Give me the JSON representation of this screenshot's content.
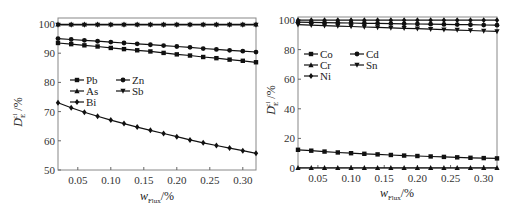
{
  "chart_data": [
    {
      "type": "line",
      "panel": "left",
      "title": "",
      "xlabel": "w_Flux/%",
      "ylabel": "D_E^cl /%",
      "xlim": [
        0.02,
        0.32
      ],
      "ylim": [
        50,
        100
      ],
      "xticks": [
        "0.05",
        "0.10",
        "0.15",
        "0.20",
        "0.25",
        "0.30"
      ],
      "yticks": [
        "50",
        "60",
        "70",
        "80",
        "90",
        "100"
      ],
      "grid": false,
      "legend_position": "upper-left-inside",
      "x": [
        0.02,
        0.04,
        0.06,
        0.08,
        0.1,
        0.12,
        0.14,
        0.16,
        0.18,
        0.2,
        0.22,
        0.24,
        0.26,
        0.28,
        0.3,
        0.32
      ],
      "series": [
        {
          "name": "Pb",
          "marker": "square",
          "values": [
            93.5,
            93.1,
            92.7,
            92.3,
            91.8,
            91.4,
            91.0,
            90.6,
            90.1,
            89.6,
            89.2,
            88.7,
            88.3,
            87.8,
            87.4,
            86.9
          ]
        },
        {
          "name": "Zn",
          "marker": "circle",
          "values": [
            95.0,
            94.7,
            94.4,
            94.1,
            93.8,
            93.5,
            93.2,
            92.9,
            92.6,
            92.3,
            92.0,
            91.6,
            91.3,
            91.0,
            90.7,
            90.4
          ]
        },
        {
          "name": "As",
          "marker": "triangle-up",
          "values": [
            99.9,
            99.9,
            99.9,
            99.9,
            99.9,
            99.9,
            99.9,
            99.9,
            99.9,
            99.9,
            99.9,
            99.9,
            99.9,
            99.9,
            99.9,
            99.9
          ]
        },
        {
          "name": "Sb",
          "marker": "triangle-down",
          "values": [
            99.7,
            99.7,
            99.7,
            99.7,
            99.7,
            99.7,
            99.7,
            99.7,
            99.7,
            99.7,
            99.7,
            99.7,
            99.7,
            99.7,
            99.7,
            99.7
          ]
        },
        {
          "name": "Bi",
          "marker": "diamond",
          "values": [
            73.0,
            71.3,
            69.8,
            68.4,
            67.1,
            65.9,
            64.7,
            63.6,
            62.5,
            61.4,
            60.3,
            59.3,
            58.4,
            57.5,
            56.6,
            55.7
          ]
        }
      ]
    },
    {
      "type": "line",
      "panel": "right",
      "title": "",
      "xlabel": "w_Flux/%",
      "ylabel": "D_E^cl /%",
      "xlim": [
        0.02,
        0.32
      ],
      "ylim": [
        0,
        100
      ],
      "xticks": [
        "0.05",
        "0.10",
        "0.15",
        "0.20",
        "0.25",
        "0.30"
      ],
      "yticks": [
        "0",
        "20",
        "40",
        "60",
        "80",
        "100"
      ],
      "grid": false,
      "legend_position": "upper-left-inside",
      "x": [
        0.02,
        0.04,
        0.06,
        0.08,
        0.1,
        0.12,
        0.14,
        0.16,
        0.18,
        0.2,
        0.22,
        0.24,
        0.26,
        0.28,
        0.3,
        0.32
      ],
      "series": [
        {
          "name": "Co",
          "marker": "square",
          "values": [
            12.3,
            11.7,
            11.1,
            10.5,
            10.0,
            9.6,
            9.2,
            8.8,
            8.4,
            8.1,
            7.8,
            7.5,
            7.2,
            6.9,
            6.7,
            6.5
          ]
        },
        {
          "name": "Cd",
          "marker": "circle",
          "values": [
            98.5,
            98.4,
            98.2,
            98.1,
            98.0,
            97.8,
            97.7,
            97.6,
            97.4,
            97.3,
            97.2,
            97.0,
            96.9,
            96.8,
            96.6,
            96.5
          ]
        },
        {
          "name": "Cr",
          "marker": "triangle-up",
          "values": [
            0.1,
            0.1,
            0.1,
            0.1,
            0.1,
            0.1,
            0.1,
            0.1,
            0.1,
            0.1,
            0.1,
            0.1,
            0.1,
            0.1,
            0.1,
            0.1
          ]
        },
        {
          "name": "Sn",
          "marker": "triangle-down",
          "values": [
            96.8,
            96.5,
            96.2,
            95.9,
            95.6,
            95.3,
            95.0,
            94.7,
            94.4,
            94.1,
            93.8,
            93.5,
            93.2,
            92.9,
            92.6,
            92.3
          ]
        },
        {
          "name": "Ni",
          "marker": "diamond",
          "values": [
            99.9,
            99.9,
            99.9,
            99.9,
            99.9,
            99.9,
            99.9,
            99.9,
            99.9,
            99.9,
            99.9,
            99.9,
            99.9,
            99.9,
            99.9,
            99.9
          ]
        }
      ]
    }
  ],
  "left_panel": {
    "ylabel_main": "D",
    "ylabel_sub": "E",
    "ylabel_sup": "cl",
    "ylabel_unit": " /%",
    "xlabel_main": "w",
    "xlabel_sub": "Flux",
    "xlabel_unit": "/%"
  },
  "right_panel": {
    "ylabel_main": "D",
    "ylabel_sub": "E",
    "ylabel_sup": "cl",
    "ylabel_unit": " /%",
    "xlabel_main": "w",
    "xlabel_sub": "Flux",
    "xlabel_unit": "/%"
  }
}
